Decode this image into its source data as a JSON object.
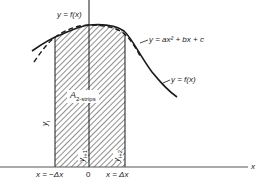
{
  "diagram": {
    "labels": {
      "curve_top": "y = f(x)",
      "parabola": "y = ax² + bx + c",
      "curve_right": "y = f(x)",
      "area": "A",
      "area_sub": "2-strips",
      "y_i": "y",
      "y_i_sub": "i",
      "y_i1": "y",
      "y_i1_sub": "i+1",
      "y_i2": "y",
      "y_i2_sub": "i+2",
      "x_left": "x = −Δx",
      "x_zero": "0",
      "x_right": "x = Δx",
      "x_axis": "x"
    },
    "colors": {
      "stroke": "#1a1a1a",
      "hatch": "#333333",
      "background": "#ffffff"
    }
  }
}
